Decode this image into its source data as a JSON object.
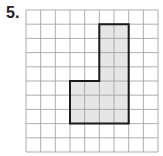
{
  "problem": {
    "label": "5."
  },
  "grid": {
    "cols": 9,
    "rows": 10,
    "x0": 26,
    "y0": 10,
    "cell_w": 14.67,
    "cell_h": 14.2,
    "line_color": "#9a9a9a"
  },
  "shape": {
    "name": "L-shaped polygon",
    "fill": "#e6e6e6",
    "stroke": "#1a1a1a",
    "vertices_grid": [
      [
        5,
        1
      ],
      [
        7,
        1
      ],
      [
        7,
        8
      ],
      [
        3,
        8
      ],
      [
        3,
        5
      ],
      [
        5,
        5
      ]
    ]
  }
}
